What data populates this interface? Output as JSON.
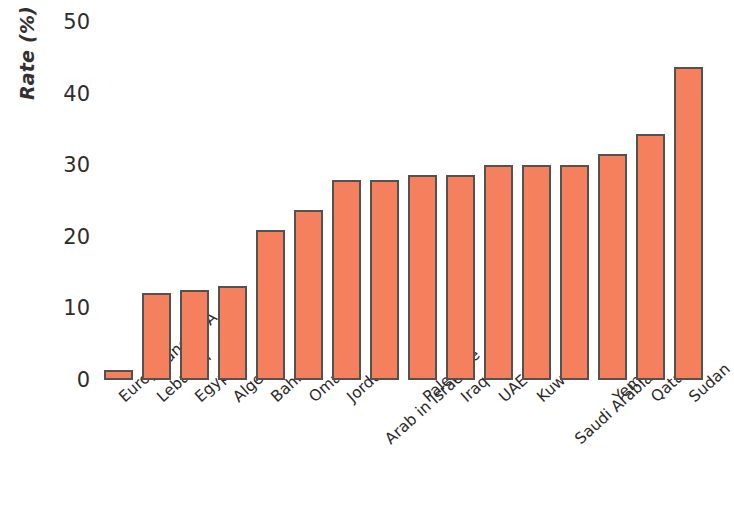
{
  "chart_data": {
    "type": "bar",
    "title": "",
    "subtitle": "",
    "xlabel": "",
    "ylabel": "Rate (%)",
    "ylim": [
      0,
      50
    ],
    "yticks": [
      0,
      10,
      20,
      30,
      40,
      50
    ],
    "grid": false,
    "legend": null,
    "bar_color": "#f4805e",
    "bar_edge_color": "#55514f",
    "note": "Rightmost bar (Sudan) is clipped by the right edge of the image.",
    "categories": [
      "Europe and USA",
      "Lebanon",
      "Egypt",
      "Algeria",
      "Bahrain",
      "Oman",
      "Jordan",
      "Arab in Israel",
      "Palestine",
      "Iraq",
      "UAE",
      "Kuwait",
      "Saudi Arabia",
      "Yemen",
      "Qatar",
      "Sudan"
    ],
    "values": [
      1.4,
      12.2,
      12.6,
      13.1,
      21.0,
      23.7,
      28.0,
      28.0,
      28.6,
      28.6,
      30.0,
      30.0,
      30.0,
      31.5,
      34.3,
      43.7
    ]
  },
  "axis": {
    "y_title": "Rate (%)",
    "tick_labels": [
      "50",
      "40",
      "30",
      "20",
      "10",
      "0"
    ]
  }
}
